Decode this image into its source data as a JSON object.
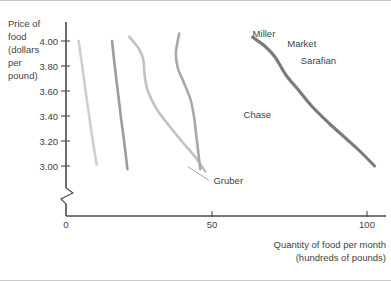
{
  "chart_data": {
    "type": "line",
    "title": "",
    "xlabel": "Quantity of food per month (hundreds of pounds)",
    "xlabel_line1": "Quantity of food per month",
    "xlabel_line2": "(hundreds of pounds)",
    "ylabel": "Price of food (dollars per pound)",
    "ylabel_lines": [
      "Price of",
      "food",
      "(dollars",
      "per",
      "pound)"
    ],
    "xlim": [
      0,
      110
    ],
    "ylim": [
      2.9,
      4.1
    ],
    "grid": false,
    "legend": "inline-labels",
    "y_ticks": [
      "4.00",
      "3.80",
      "3.60",
      "3.40",
      "3.20",
      "3.00"
    ],
    "y_tick_values": [
      4.0,
      3.8,
      3.6,
      3.4,
      3.2,
      3.0
    ],
    "x_ticks": [
      "0",
      "50",
      "100"
    ],
    "x_tick_values": [
      0,
      50,
      100
    ],
    "axis_break_on_y": true,
    "series": [
      {
        "name": "Gruber",
        "color": "#cfcfcf",
        "label_x": 49,
        "label_y": 2.855,
        "leader_from": [
          47.5,
          2.885
        ],
        "leader_to": [
          40.5,
          2.995
        ],
        "points": [
          [
            4.2,
            4.0
          ],
          [
            5.4,
            3.8
          ],
          [
            6.5,
            3.6
          ],
          [
            7.7,
            3.4
          ],
          [
            8.9,
            3.2
          ],
          [
            10.2,
            3.01
          ]
        ]
      },
      {
        "name": "Chase",
        "color": "#9c9c9c",
        "label_x": 59,
        "label_y": 3.385,
        "points": [
          [
            15.3,
            4.0
          ],
          [
            16.2,
            3.8
          ],
          [
            17.2,
            3.6
          ],
          [
            18.2,
            3.4
          ],
          [
            19.3,
            3.2
          ],
          [
            20.4,
            2.975
          ]
        ]
      },
      {
        "name": "Miller",
        "color": "#c2c2c2",
        "label_x": 62,
        "label_y": 4.035,
        "points": [
          [
            21.0,
            4.035
          ],
          [
            24.0,
            3.945
          ],
          [
            25.6,
            3.86
          ],
          [
            26.2,
            3.71
          ],
          [
            27.2,
            3.6
          ],
          [
            30.0,
            3.46
          ],
          [
            34.0,
            3.33
          ],
          [
            38.4,
            3.2
          ],
          [
            43.0,
            3.07
          ],
          [
            46.3,
            2.955
          ]
        ]
      },
      {
        "name": "Sarafian",
        "color": "#a8a8a8",
        "label_x": 78,
        "label_y": 3.815,
        "points": [
          [
            37.6,
            4.06
          ],
          [
            36.5,
            3.9
          ],
          [
            37.2,
            3.78
          ],
          [
            39.3,
            3.66
          ],
          [
            41.4,
            3.53
          ],
          [
            42.5,
            3.4
          ],
          [
            43.2,
            3.26
          ],
          [
            43.9,
            3.12
          ],
          [
            44.6,
            2.975
          ]
        ]
      },
      {
        "name": "Market",
        "color": "#7a7a7a",
        "label_x": 73.5,
        "label_y": 3.95,
        "points": [
          [
            62.0,
            4.03
          ],
          [
            66.0,
            3.96
          ],
          [
            69.5,
            3.87
          ],
          [
            73.0,
            3.73
          ],
          [
            77.5,
            3.6
          ],
          [
            82.0,
            3.47
          ],
          [
            87.5,
            3.34
          ],
          [
            93.0,
            3.22
          ],
          [
            98.0,
            3.11
          ],
          [
            102.5,
            3.0
          ]
        ]
      }
    ]
  },
  "axes": {
    "y_axis_name": "price-axis",
    "x_axis_name": "quantity-axis"
  }
}
